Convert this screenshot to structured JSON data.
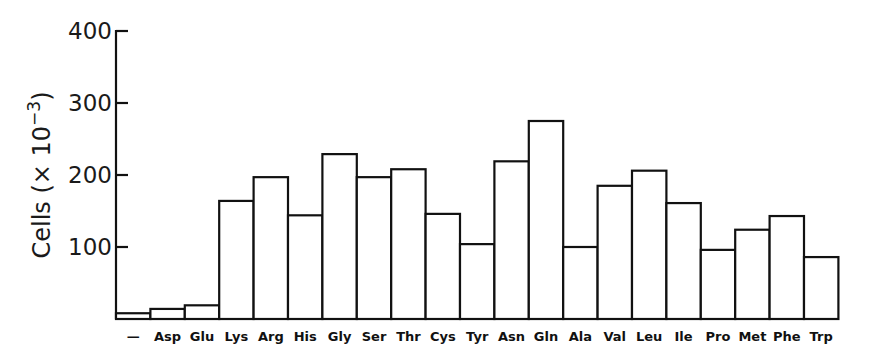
{
  "chart_data": {
    "type": "bar",
    "title": "",
    "xlabel": "",
    "ylabel": "Cells (× 10⁻³)",
    "ylabel_parts": {
      "text": "Cells (× 10",
      "superscript": "−3",
      "close": ")"
    },
    "ylim": [
      0,
      400
    ],
    "yticks": [
      100,
      200,
      300,
      400
    ],
    "grid": false,
    "legend": null,
    "categories": [
      "—",
      "Asp",
      "Glu",
      "Lys",
      "Arg",
      "His",
      "Gly",
      "Ser",
      "Thr",
      "Cys",
      "Tyr",
      "Asn",
      "Gln",
      "Ala",
      "Val",
      "Leu",
      "Ile",
      "Pro",
      "Met",
      "Phe",
      "Trp"
    ],
    "values": [
      8,
      14,
      19,
      164,
      197,
      144,
      229,
      197,
      208,
      146,
      104,
      219,
      275,
      100,
      185,
      206,
      161,
      96,
      124,
      143,
      86
    ],
    "style": {
      "bar_fill": "#ffffff",
      "bar_stroke": "#111111"
    }
  }
}
